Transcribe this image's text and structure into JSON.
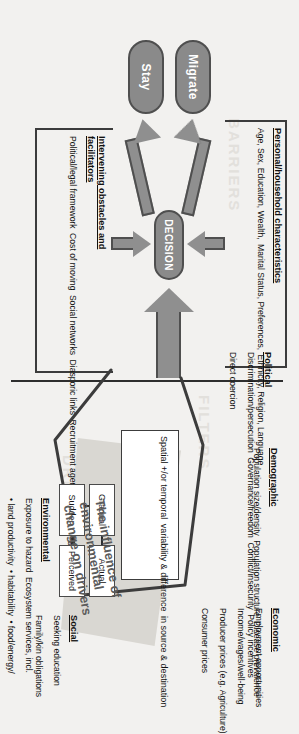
{
  "figure": {
    "caption_line1": "The influence of",
    "caption_line2": "environmental",
    "caption_line3": "change on drivers"
  },
  "outcomes": [
    {
      "id": "migrate",
      "label": "Migrate"
    },
    {
      "id": "stay",
      "label": "Stay"
    }
  ],
  "decision": {
    "label": "DECISION"
  },
  "watermarks": [
    {
      "id": "wm-left",
      "text": "BARRIERS"
    },
    {
      "id": "wm-right",
      "text": "FILTERS"
    },
    {
      "id": "wm-drivers",
      "text": "DRIVERS"
    }
  ],
  "personal_box": {
    "title": "Personal/household characteristics",
    "items": [
      "Age, Sex, Education, Wealth,",
      "Marital Status, Preferences,",
      "Ethnicity, Religion, Language"
    ]
  },
  "obstacles_box": {
    "title_line1": "Intervening obstacles and",
    "title_line2": "facilitators",
    "items": [
      "Political/legal framework",
      "Cost of moving",
      "Social networks",
      "Diasporic links",
      "Recruitment agencies",
      "Technology"
    ]
  },
  "drivers": [
    {
      "id": "political",
      "title": "Political",
      "items": [
        "Discrimination/persecution",
        "Governance/freedom",
        "Conflict/insecurity",
        "Policy incentives",
        "Direct coercion"
      ]
    },
    {
      "id": "demographic",
      "title": "Demographic",
      "items": [
        "Population size/density",
        "Population structure",
        "Disease prevalence"
      ]
    },
    {
      "id": "economic",
      "title": "Economic",
      "items": [
        "Employment opportunities",
        "Income/wages/well-being",
        "Producer prices (e.g. Agriculture)",
        "Consumer prices"
      ]
    },
    {
      "id": "social",
      "title": "Social",
      "items": [
        "Seeking education",
        "Family/kin obligations"
      ]
    },
    {
      "id": "environmental",
      "title": "Environmental",
      "items": [
        "Exposure to hazard",
        "Ecosystem services, incl.",
        "• land productivity",
        "• habitability",
        "• food/energy/",
        "   water security"
      ]
    }
  ],
  "variability_box": {
    "line1": "Spatial +/or temporal",
    "line2": "variability & difference",
    "line3": "in source & destination",
    "cells": [
      {
        "id": "gradual",
        "label": "Gradual"
      },
      {
        "id": "actual",
        "label": "Actual"
      },
      {
        "id": "sudden",
        "label": "Sudden"
      },
      {
        "id": "perceived",
        "label": "Perceived"
      }
    ]
  },
  "colors": {
    "node_fill": "#8a8a8a",
    "node_stroke": "#4f4f4f",
    "arrow_fill": "#8f8f8f",
    "line": "#3c3c3c",
    "shadow": "#d9d7d2",
    "background": "#f2f1ef"
  }
}
